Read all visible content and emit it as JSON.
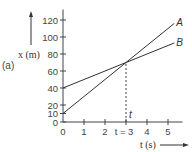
{
  "chart_data": {
    "type": "line",
    "title": "",
    "panel_label": "(a)",
    "xlabel": "t (s)",
    "ylabel": "x (m)",
    "xlim": [
      0,
      5.5
    ],
    "ylim": [
      0,
      130
    ],
    "x_ticks": [
      0,
      1,
      2,
      3,
      4,
      5
    ],
    "x_tick_labels": [
      "0",
      "1",
      "2",
      "t = 3",
      "4",
      "5"
    ],
    "y_ticks": [
      0,
      10,
      20,
      40,
      60,
      80,
      100,
      120
    ],
    "y_tick_labels": [
      "0",
      "10",
      "20",
      "40",
      "60",
      "80",
      "100",
      "120"
    ],
    "grid": false,
    "series": [
      {
        "name": "A",
        "x": [
          0,
          3,
          5.3
        ],
        "values": [
          10,
          70,
          116
        ]
      },
      {
        "name": "B",
        "x": [
          0,
          3,
          5.3
        ],
        "values": [
          40,
          70,
          93
        ]
      }
    ],
    "annotations": [
      {
        "type": "dashed-vertical",
        "x": 3,
        "from_y": 0,
        "to_y": 70,
        "label": "t"
      }
    ]
  }
}
